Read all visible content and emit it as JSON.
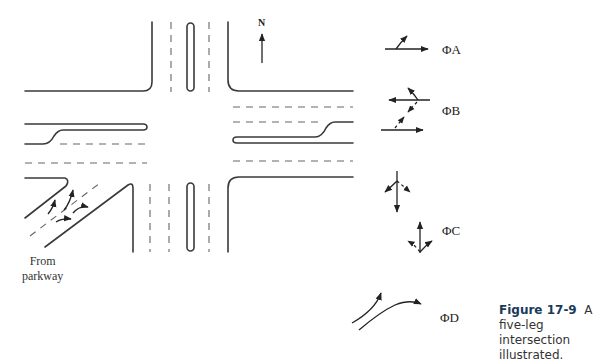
{
  "diagram": {
    "north_label": "N",
    "from_label_line1": "From",
    "from_label_line2": "parkway",
    "phases": [
      {
        "id": "A",
        "label": "ΦA"
      },
      {
        "id": "B",
        "label": "ΦB"
      },
      {
        "id": "C",
        "label": "ΦC"
      },
      {
        "id": "D",
        "label": "ΦD"
      }
    ]
  },
  "caption": {
    "figure_number": "Figure 17-9",
    "text": "A five-leg intersection illustrated."
  },
  "colors": {
    "line": "#3a3a3a",
    "caption_number": "#1a3a5a"
  }
}
